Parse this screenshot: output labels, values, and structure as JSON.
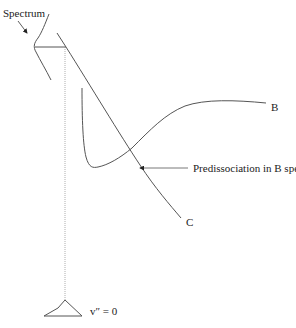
{
  "diagram": {
    "labels": {
      "spectrum": "Spectrum",
      "curve_b": "B",
      "curve_c": "C",
      "predissociation": "Predissociation in B spectrum",
      "ground_level": "v″ = 0"
    },
    "colors": {
      "curve": "#555555",
      "dotted": "#9a9a9a",
      "text": "#222222"
    }
  }
}
